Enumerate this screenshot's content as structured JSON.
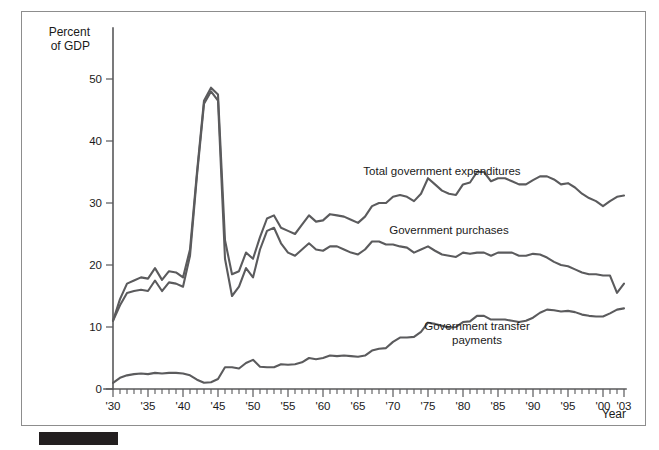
{
  "figure": {
    "border_color": "#8d8d8d",
    "line_color": "#5b5b5d",
    "caption_bar_color": "#231f20"
  },
  "chart_data": {
    "type": "line",
    "title": "",
    "ylabel_line1": "Percent",
    "ylabel_line2": "of GDP",
    "xlabel": "Year",
    "ylim": [
      0,
      53
    ],
    "xlim": [
      1930,
      2003
    ],
    "grid": false,
    "legend_position": "inline-annotations",
    "yticks": [
      0,
      10,
      20,
      30,
      40,
      50
    ],
    "ytick_labels": [
      "0",
      "10",
      "20",
      "30",
      "40",
      "50"
    ],
    "xticks": [
      1930,
      1935,
      1940,
      1945,
      1950,
      1955,
      1960,
      1965,
      1970,
      1975,
      1980,
      1985,
      1990,
      1995,
      2000,
      2003
    ],
    "xtick_labels": [
      "'30",
      "'35",
      "'40",
      "'45",
      "'50",
      "'55",
      "'60",
      "'65",
      "'70",
      "'75",
      "'80",
      "'85",
      "'90",
      "'95",
      "'00",
      "'03"
    ],
    "x": [
      1930,
      1931,
      1932,
      1933,
      1934,
      1935,
      1936,
      1937,
      1938,
      1939,
      1940,
      1941,
      1942,
      1943,
      1944,
      1945,
      1946,
      1947,
      1948,
      1949,
      1950,
      1951,
      1952,
      1953,
      1954,
      1955,
      1956,
      1957,
      1958,
      1959,
      1960,
      1961,
      1962,
      1963,
      1964,
      1965,
      1966,
      1967,
      1968,
      1969,
      1970,
      1971,
      1972,
      1973,
      1974,
      1975,
      1976,
      1977,
      1978,
      1979,
      1980,
      1981,
      1982,
      1983,
      1984,
      1985,
      1986,
      1987,
      1988,
      1989,
      1990,
      1991,
      1992,
      1993,
      1994,
      1995,
      1996,
      1997,
      1998,
      1999,
      2000,
      2001,
      2002,
      2003
    ],
    "series": [
      {
        "name": "Total government expenditures",
        "label_x": 1977,
        "label_y": 34.5,
        "values": [
          11.0,
          14.5,
          17.0,
          17.5,
          18.0,
          17.8,
          19.5,
          17.6,
          19.0,
          18.8,
          18.0,
          22.5,
          35.0,
          46.5,
          48.6,
          47.5,
          24.0,
          18.5,
          19.0,
          22.0,
          21.0,
          24.5,
          27.5,
          28.0,
          26.0,
          25.5,
          25.0,
          26.5,
          28.0,
          27.0,
          27.2,
          28.2,
          28.0,
          27.8,
          27.3,
          26.8,
          27.8,
          29.5,
          30.0,
          30.0,
          31.0,
          31.3,
          31.0,
          30.3,
          31.5,
          34.0,
          33.0,
          32.0,
          31.5,
          31.3,
          33.0,
          33.3,
          35.0,
          35.0,
          33.5,
          34.0,
          34.0,
          33.5,
          33.0,
          33.0,
          33.7,
          34.3,
          34.3,
          33.8,
          33.0,
          33.2,
          32.5,
          31.5,
          30.8,
          30.3,
          29.5,
          30.3,
          31.0,
          31.2
        ]
      },
      {
        "name": "Government purchases",
        "label_x": 1978,
        "label_y": 25.0,
        "values": [
          11.0,
          13.5,
          15.5,
          15.8,
          16.0,
          15.8,
          17.5,
          15.8,
          17.2,
          17.0,
          16.5,
          21.5,
          34.5,
          46.0,
          48.0,
          46.5,
          21.0,
          15.0,
          16.5,
          19.5,
          18.0,
          22.5,
          25.5,
          26.0,
          23.5,
          22.0,
          21.5,
          22.5,
          23.5,
          22.5,
          22.3,
          23.0,
          23.0,
          22.5,
          22.0,
          21.7,
          22.5,
          23.8,
          23.8,
          23.3,
          23.3,
          23.0,
          22.8,
          22.0,
          22.5,
          23.0,
          22.3,
          21.7,
          21.5,
          21.3,
          22.0,
          21.8,
          22.0,
          22.0,
          21.5,
          22.0,
          22.0,
          22.0,
          21.5,
          21.5,
          21.8,
          21.7,
          21.2,
          20.5,
          20.0,
          19.8,
          19.3,
          18.8,
          18.5,
          18.5,
          18.3,
          18.3,
          15.5,
          17.0
        ]
      },
      {
        "name": "Government transfer payments",
        "label_x": 1982,
        "label_y": 9.5,
        "label_line2": "payments",
        "values": [
          1.0,
          1.8,
          2.2,
          2.4,
          2.5,
          2.4,
          2.6,
          2.5,
          2.6,
          2.6,
          2.5,
          2.2,
          1.5,
          1.0,
          1.1,
          1.6,
          3.5,
          3.5,
          3.3,
          4.2,
          4.7,
          3.6,
          3.5,
          3.5,
          4.0,
          3.9,
          4.0,
          4.3,
          5.0,
          4.8,
          5.0,
          5.4,
          5.3,
          5.4,
          5.3,
          5.2,
          5.4,
          6.2,
          6.5,
          6.6,
          7.6,
          8.3,
          8.3,
          8.4,
          9.2,
          10.7,
          10.5,
          10.2,
          9.9,
          10.0,
          10.8,
          10.9,
          11.8,
          11.8,
          11.2,
          11.2,
          11.2,
          11.0,
          10.8,
          11.0,
          11.5,
          12.3,
          12.8,
          12.7,
          12.5,
          12.6,
          12.4,
          12.0,
          11.8,
          11.7,
          11.7,
          12.2,
          12.8,
          13.0
        ]
      }
    ]
  }
}
